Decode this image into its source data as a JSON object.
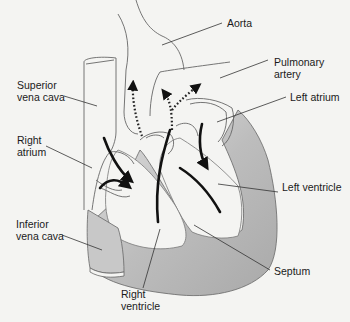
{
  "diagram": {
    "colors": {
      "background": "#f4f4f2",
      "outline": "#555555",
      "muscle_fill": "#b9b9b9",
      "muscle_fill_light": "#d6d6d6",
      "flow_arrow": "#111111",
      "leader_line": "#333333"
    },
    "labels": [
      {
        "id": "aorta",
        "text": "Aorta"
      },
      {
        "id": "pulmonary-artery",
        "text": "Pulmonary\nartery"
      },
      {
        "id": "superior-vena-cava",
        "text": "Superior\nvena cava"
      },
      {
        "id": "left-atrium",
        "text": "Left atrium"
      },
      {
        "id": "right-atrium",
        "text": "Right\natrium"
      },
      {
        "id": "left-ventricle",
        "text": "Left ventricle"
      },
      {
        "id": "inferior-vena-cava",
        "text": "Inferior\nvena cava"
      },
      {
        "id": "septum",
        "text": "Septum"
      },
      {
        "id": "right-ventricle",
        "text": "Right\nventricle"
      }
    ],
    "arrows": {
      "solid": "blood flow direction within heart chambers",
      "dotted": "blood flow exiting through aorta and pulmonary artery"
    }
  }
}
